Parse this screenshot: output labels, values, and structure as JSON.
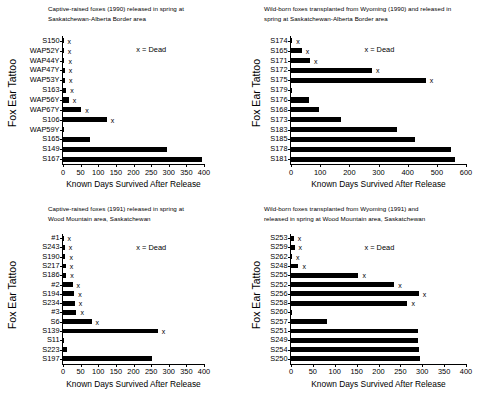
{
  "figure": {
    "axis_y_label": "Fox Ear Tattoo",
    "axis_x_label": "Known Days Survived After Release",
    "legend_text": "x = Dead",
    "dead_marker": "x"
  },
  "chart_data": [
    {
      "type": "bar",
      "orientation": "horizontal",
      "panel": "top-left",
      "title": "Captive-raised foxes (1990) released in spring at Saskatchewan-Alberta Border area",
      "title_lines": [
        "Captive-raised foxes (1990) released in spring at",
        "Saskatchewan-Alberta Border area"
      ],
      "xlabel": "Known Days Survived After Release",
      "ylabel": "Fox Ear Tattoo",
      "xlim": [
        0,
        400
      ],
      "xticks": [
        0,
        50,
        100,
        150,
        200,
        250,
        300,
        350,
        400
      ],
      "grid": false,
      "legend": "x = Dead",
      "categories": [
        "S150",
        "WAP52Y",
        "WAP44Y",
        "WAP47Y",
        "WAP53Y",
        "S163",
        "WAP56Y",
        "WAP67Y",
        "S106",
        "WAP59Y",
        "S165",
        "S149",
        "S167"
      ],
      "values": [
        1,
        2,
        4,
        5,
        6,
        9,
        16,
        52,
        124,
        2,
        78,
        294,
        394
      ],
      "dead": [
        true,
        true,
        true,
        true,
        true,
        true,
        true,
        true,
        true,
        false,
        false,
        false,
        false
      ]
    },
    {
      "type": "bar",
      "orientation": "horizontal",
      "panel": "top-right",
      "title": "Wild-born foxes transplanted from Wyoming (1990) and released in spring at Saskatchewan-Alberta Border area",
      "title_lines": [
        "Wild-born foxes transplanted from Wyoming (1990) and released in",
        "spring at Saskatchewan-Alberta Border area"
      ],
      "xlabel": "Known Days Survived After Release",
      "ylabel": "Fox Ear Tattoo",
      "xlim": [
        0,
        600
      ],
      "xticks": [
        0,
        100,
        200,
        300,
        400,
        500,
        600
      ],
      "grid": false,
      "legend": "x = Dead",
      "categories": [
        "S174",
        "S165",
        "S171",
        "S172",
        "S175",
        "S179",
        "S176",
        "S168",
        "S173",
        "S183",
        "S185",
        "S178",
        "S181"
      ],
      "values": [
        4,
        37,
        65,
        278,
        462,
        1,
        60,
        97,
        172,
        362,
        425,
        550,
        562
      ],
      "dead": [
        true,
        true,
        true,
        true,
        true,
        false,
        false,
        false,
        false,
        false,
        false,
        false,
        false
      ]
    },
    {
      "type": "bar",
      "orientation": "horizontal",
      "panel": "bottom-left",
      "title": "Captive-raised foxes (1991) released in spring at Wood Mountain area, Saskatchewan",
      "title_lines": [
        "Captive-raised foxes (1991) released in spring at",
        "Wood Mountain area, Saskatchewan"
      ],
      "xlabel": "Known Days Survived After Release",
      "ylabel": "Fox Ear Tattoo",
      "xlim": [
        0,
        400
      ],
      "xticks": [
        0,
        50,
        100,
        150,
        200,
        250,
        300,
        350,
        400
      ],
      "grid": false,
      "legend": "x = Dead",
      "categories": [
        "#1",
        "S243",
        "S190",
        "S217",
        "S186",
        "#2",
        "S194",
        "S234",
        "#3",
        "S6",
        "S139",
        "S11",
        "S223",
        "S197"
      ],
      "values": [
        1,
        5,
        7,
        8,
        9,
        27,
        32,
        33,
        38,
        81,
        269,
        2,
        10,
        253
      ],
      "dead": [
        true,
        true,
        true,
        true,
        true,
        true,
        true,
        true,
        true,
        true,
        true,
        false,
        false,
        false
      ]
    },
    {
      "type": "bar",
      "orientation": "horizontal",
      "panel": "bottom-right",
      "title": "Wild-born foxes transplanted from Wyoming (1991) and released in spring at Wood Mountain area, Saskatchewan",
      "title_lines": [
        "Wild-born foxes transplanted from Wyoming (1991) and",
        "released in spring at Wood Mountain area, Saskatchewan"
      ],
      "xlabel": "Known Days Survived After Release",
      "ylabel": "Fox Ear Tattoo",
      "xlim": [
        0,
        400
      ],
      "xticks": [
        0,
        50,
        100,
        150,
        200,
        250,
        300,
        350,
        400
      ],
      "grid": false,
      "legend": "x = Dead",
      "categories": [
        "S253",
        "S259",
        "S262",
        "S248",
        "S255",
        "S252",
        "S256",
        "S258",
        "S260",
        "S257",
        "S251",
        "S249",
        "S254",
        "S250"
      ],
      "values": [
        6,
        8,
        2,
        17,
        154,
        236,
        292,
        266,
        1,
        82,
        290,
        290,
        293,
        295
      ],
      "dead": [
        true,
        true,
        true,
        true,
        true,
        true,
        true,
        true,
        false,
        false,
        false,
        false,
        false,
        false
      ]
    }
  ]
}
